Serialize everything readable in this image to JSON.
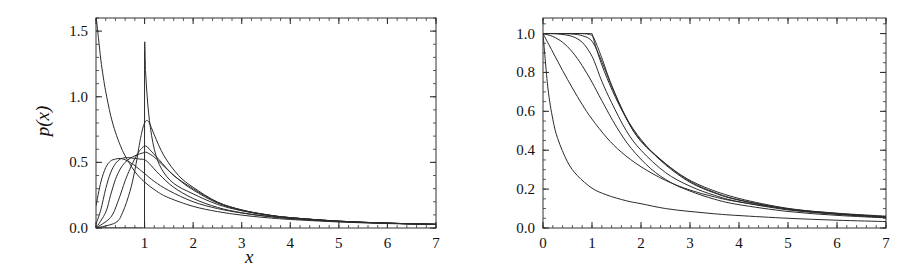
{
  "figure": {
    "background": "#ffffff",
    "curve_color": "#2b2b2b",
    "axis_color": "#333333",
    "panel_count": 2
  },
  "labels": {
    "x_axis": "x",
    "y_axis_left": "p(x)",
    "y_axis_right_base": "P",
    "y_axis_right_sub": ">",
    "y_axis_right_tail": "(x)"
  },
  "chart_data": [
    {
      "type": "line",
      "title": "",
      "xlabel": "x",
      "ylabel": "p(x)",
      "xlim": [
        0,
        7
      ],
      "ylim": [
        0,
        1.6
      ],
      "xticks": [
        0,
        1,
        2,
        3,
        4,
        5,
        6,
        7
      ],
      "xticklabels": [
        "",
        "1",
        "2",
        "3",
        "4",
        "5",
        "6",
        "7"
      ],
      "yticks": [
        0.0,
        0.5,
        1.0,
        1.5
      ],
      "yticklabels": [
        "0.0",
        "0.5",
        "1.0",
        "1.5"
      ],
      "minor_tick_step_x": 0.2,
      "minor_tick_step_y": 0.1,
      "grid": false,
      "legend": "none",
      "series": [
        {
          "name": "curve-1-monotone-decay",
          "x": [
            0.0,
            0.05,
            0.1,
            0.15,
            0.2,
            0.3,
            0.4,
            0.5,
            0.6,
            0.8,
            1.0,
            1.25,
            1.5,
            2.0,
            2.5,
            3.0,
            3.5,
            4.0,
            5.0,
            6.0,
            7.0
          ],
          "y": [
            1.62,
            1.45,
            1.28,
            1.15,
            1.04,
            0.86,
            0.73,
            0.63,
            0.55,
            0.43,
            0.35,
            0.28,
            0.23,
            0.165,
            0.125,
            0.098,
            0.079,
            0.065,
            0.046,
            0.034,
            0.027
          ]
        },
        {
          "name": "curve-2-hump-low",
          "x": [
            0.0,
            0.1,
            0.2,
            0.3,
            0.4,
            0.5,
            0.6,
            0.7,
            0.8,
            0.9,
            1.0,
            1.2,
            1.5,
            2.0,
            2.5,
            3.0,
            3.5,
            4.0,
            5.0,
            6.0,
            7.0
          ],
          "y": [
            0.17,
            0.35,
            0.46,
            0.51,
            0.525,
            0.53,
            0.52,
            0.5,
            0.475,
            0.445,
            0.415,
            0.355,
            0.285,
            0.2,
            0.148,
            0.114,
            0.09,
            0.073,
            0.05,
            0.037,
            0.028
          ]
        },
        {
          "name": "curve-3-hump-mid",
          "x": [
            0.0,
            0.1,
            0.2,
            0.3,
            0.4,
            0.5,
            0.6,
            0.7,
            0.8,
            0.9,
            1.0,
            1.1,
            1.3,
            1.6,
            2.0,
            2.5,
            3.0,
            3.5,
            4.0,
            5.0,
            6.0,
            7.0
          ],
          "y": [
            0.03,
            0.14,
            0.3,
            0.42,
            0.49,
            0.525,
            0.535,
            0.535,
            0.53,
            0.525,
            0.52,
            0.49,
            0.41,
            0.31,
            0.225,
            0.157,
            0.116,
            0.09,
            0.072,
            0.049,
            0.036,
            0.028
          ]
        },
        {
          "name": "curve-4-hump-high",
          "x": [
            0.0,
            0.2,
            0.3,
            0.4,
            0.5,
            0.6,
            0.7,
            0.8,
            0.9,
            1.0,
            1.05,
            1.2,
            1.4,
            1.7,
            2.0,
            2.5,
            3.0,
            3.5,
            4.0,
            5.0,
            6.0,
            7.0
          ],
          "y": [
            0.0,
            0.12,
            0.25,
            0.37,
            0.45,
            0.5,
            0.53,
            0.55,
            0.565,
            0.575,
            0.575,
            0.54,
            0.47,
            0.37,
            0.29,
            0.19,
            0.135,
            0.101,
            0.079,
            0.052,
            0.037,
            0.028
          ]
        },
        {
          "name": "curve-5-peak-062",
          "x": [
            0.0,
            0.3,
            0.45,
            0.6,
            0.7,
            0.8,
            0.9,
            0.95,
            1.0,
            1.05,
            1.1,
            1.3,
            1.6,
            2.0,
            2.5,
            3.0,
            3.5,
            4.0,
            5.0,
            6.0,
            7.0
          ],
          "y": [
            0.0,
            0.08,
            0.2,
            0.36,
            0.45,
            0.53,
            0.59,
            0.61,
            0.625,
            0.62,
            0.6,
            0.52,
            0.4,
            0.3,
            0.195,
            0.137,
            0.102,
            0.079,
            0.052,
            0.037,
            0.028
          ]
        },
        {
          "name": "curve-6-peak-082",
          "x": [
            0.0,
            0.4,
            0.55,
            0.7,
            0.8,
            0.9,
            0.95,
            1.0,
            1.05,
            1.1,
            1.2,
            1.4,
            1.7,
            2.0,
            2.5,
            3.0,
            3.5,
            4.0,
            5.0,
            6.0,
            7.0
          ],
          "y": [
            0.0,
            0.04,
            0.12,
            0.28,
            0.44,
            0.65,
            0.74,
            0.8,
            0.82,
            0.8,
            0.71,
            0.55,
            0.4,
            0.31,
            0.198,
            0.138,
            0.102,
            0.079,
            0.052,
            0.037,
            0.028
          ]
        },
        {
          "name": "curve-7-peak-135-sharp",
          "x": [
            0.0,
            0.5,
            0.75,
            0.9,
            0.97,
            0.999,
            1.0,
            1.02,
            1.05,
            1.1,
            1.2,
            1.35,
            1.6,
            2.0,
            2.5,
            3.0,
            3.5,
            4.0,
            5.0,
            6.0,
            7.0
          ],
          "y": [
            0.0,
            0.0,
            0.0,
            0.0,
            0.0,
            0.0,
            1.35,
            1.2,
            1.02,
            0.82,
            0.6,
            0.45,
            0.34,
            0.26,
            0.18,
            0.131,
            0.099,
            0.078,
            0.052,
            0.037,
            0.028
          ]
        }
      ]
    },
    {
      "type": "line",
      "title": "",
      "xlabel": "x",
      "ylabel": "P_>(x)",
      "xlim": [
        0,
        7
      ],
      "ylim": [
        0,
        1.08
      ],
      "xticks": [
        0,
        1,
        2,
        3,
        4,
        5,
        6,
        7
      ],
      "xticklabels": [
        "0",
        "1",
        "2",
        "3",
        "4",
        "5",
        "6",
        "7"
      ],
      "yticks": [
        0.0,
        0.2,
        0.4,
        0.6,
        0.8,
        1.0
      ],
      "yticklabels": [
        "0.0",
        "0.2",
        "0.4",
        "0.6",
        "0.8",
        "1.0"
      ],
      "minor_tick_step_x": 0.2,
      "minor_tick_step_y": 0.05,
      "grid": false,
      "legend": "none",
      "series": [
        {
          "name": "ccdf-1-fast-decay",
          "x": [
            0.0,
            0.1,
            0.2,
            0.3,
            0.5,
            0.7,
            1.0,
            1.3,
            1.7,
            2.0,
            2.5,
            3.0,
            3.5,
            4.0,
            5.0,
            6.0,
            7.0
          ],
          "y": [
            1.0,
            0.72,
            0.56,
            0.46,
            0.34,
            0.27,
            0.205,
            0.17,
            0.14,
            0.125,
            0.1,
            0.085,
            0.073,
            0.064,
            0.05,
            0.04,
            0.033
          ]
        },
        {
          "name": "ccdf-2",
          "x": [
            0.0,
            0.2,
            0.4,
            0.6,
            0.8,
            1.0,
            1.3,
            1.6,
            2.0,
            2.5,
            3.0,
            3.5,
            4.0,
            5.0,
            6.0,
            7.0
          ],
          "y": [
            1.0,
            0.905,
            0.81,
            0.72,
            0.635,
            0.56,
            0.465,
            0.39,
            0.315,
            0.245,
            0.195,
            0.16,
            0.134,
            0.098,
            0.076,
            0.061
          ]
        },
        {
          "name": "ccdf-3",
          "x": [
            0.0,
            0.2,
            0.4,
            0.6,
            0.8,
            1.0,
            1.2,
            1.5,
            1.8,
            2.2,
            2.6,
            3.0,
            3.5,
            4.0,
            5.0,
            6.0,
            7.0
          ],
          "y": [
            1.0,
            0.985,
            0.955,
            0.905,
            0.835,
            0.75,
            0.655,
            0.52,
            0.41,
            0.305,
            0.235,
            0.19,
            0.148,
            0.12,
            0.085,
            0.065,
            0.052
          ]
        },
        {
          "name": "ccdf-4",
          "x": [
            0.0,
            0.3,
            0.6,
            0.8,
            0.95,
            1.05,
            1.2,
            1.4,
            1.7,
            2.0,
            2.5,
            3.0,
            3.5,
            4.0,
            5.0,
            6.0,
            7.0
          ],
          "y": [
            1.0,
            0.998,
            0.985,
            0.955,
            0.905,
            0.855,
            0.755,
            0.645,
            0.5,
            0.4,
            0.285,
            0.215,
            0.168,
            0.135,
            0.093,
            0.07,
            0.055
          ]
        },
        {
          "name": "ccdf-5",
          "x": [
            0.0,
            0.4,
            0.7,
            0.9,
            1.0,
            1.1,
            1.25,
            1.45,
            1.75,
            2.1,
            2.5,
            3.0,
            3.5,
            4.0,
            5.0,
            6.0,
            7.0
          ],
          "y": [
            1.0,
            1.0,
            0.995,
            0.98,
            0.96,
            0.915,
            0.825,
            0.7,
            0.545,
            0.425,
            0.325,
            0.235,
            0.18,
            0.143,
            0.097,
            0.072,
            0.056
          ]
        },
        {
          "name": "ccdf-6",
          "x": [
            0.0,
            0.5,
            0.8,
            0.95,
            1.02,
            1.1,
            1.2,
            1.4,
            1.7,
            2.0,
            2.5,
            3.0,
            3.5,
            4.0,
            5.0,
            6.0,
            7.0
          ],
          "y": [
            1.0,
            1.0,
            1.0,
            0.995,
            0.985,
            0.94,
            0.875,
            0.735,
            0.565,
            0.445,
            0.33,
            0.24,
            0.183,
            0.145,
            0.098,
            0.073,
            0.056
          ]
        },
        {
          "name": "ccdf-7-plateau-sharp",
          "x": [
            0.0,
            0.6,
            0.9,
            1.0,
            1.001,
            1.05,
            1.15,
            1.3,
            1.55,
            1.9,
            2.3,
            2.8,
            3.3,
            4.0,
            5.0,
            6.0,
            7.0
          ],
          "y": [
            1.0,
            1.0,
            1.0,
            1.0,
            1.0,
            0.955,
            0.875,
            0.775,
            0.635,
            0.48,
            0.375,
            0.275,
            0.21,
            0.152,
            0.101,
            0.075,
            0.058
          ]
        }
      ]
    }
  ]
}
